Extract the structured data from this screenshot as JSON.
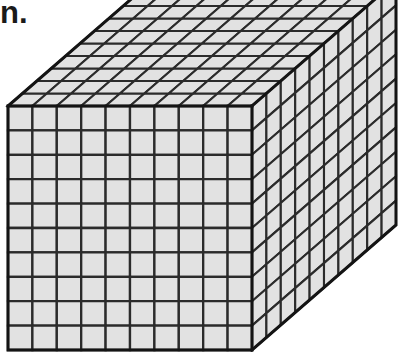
{
  "page": {
    "width": 417,
    "height": 352,
    "background_color": "#ffffff"
  },
  "caption": {
    "text": "n.",
    "note_visible_fragment": true
  },
  "figure": {
    "name": "base-ten-thousand-cube",
    "kind": "3d-unit-cube-block",
    "fill_color": "#e2e2e2",
    "line_color": "#2b2b2b",
    "outline_color": "#141414",
    "units_wide": 10,
    "units_high": 10,
    "units_deep": 10,
    "total_unit_cubes": 1000,
    "faces": [
      {
        "name": "front-face",
        "rows": 10,
        "cols": 10,
        "cells": 100
      },
      {
        "name": "top-face",
        "rows": 10,
        "cols": 10,
        "cells": 100
      },
      {
        "name": "right-face",
        "rows": 10,
        "cols": 10,
        "cells": 100
      }
    ],
    "geometry": {
      "front_top_left": [
        8,
        106
      ],
      "front_top_right": [
        252,
        106
      ],
      "front_bottom_left": [
        8,
        350
      ],
      "front_bottom_right": [
        252,
        350
      ],
      "depth_offset_x": 144,
      "depth_offset_y": -125,
      "cropped_top": true,
      "cropped_bottom": true
    }
  }
}
